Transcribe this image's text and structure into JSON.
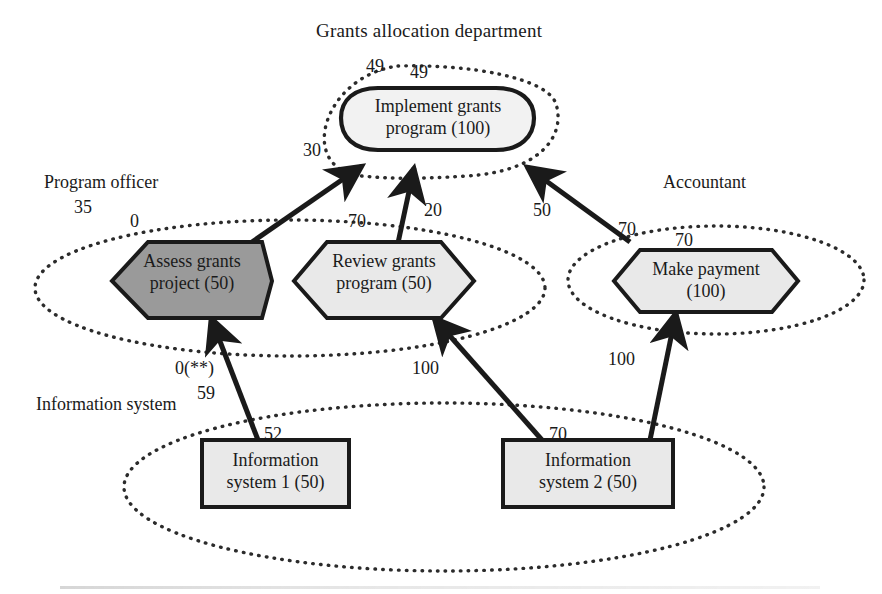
{
  "diagram": {
    "title": "Grants allocation department",
    "type": "actor-activity-flow-diagram",
    "colors": {
      "stroke": "#1a1a1a",
      "node_fill_light": "#e8e8e8",
      "node_fill_dark": "#9a9a9a",
      "boundary_dotted": "#2b2b2b",
      "background": "#ffffff"
    }
  },
  "swimlanes": [
    {
      "id": "grants-department",
      "label": "Grants allocation department",
      "boundary": "dotted-rounded"
    },
    {
      "id": "program-officer",
      "label": "Program officer",
      "boundary": "dotted-ellipse"
    },
    {
      "id": "accountant",
      "label": "Accountant",
      "boundary": "dotted-ellipse"
    },
    {
      "id": "information-system",
      "label": "Information system",
      "boundary": "dotted-ellipse"
    }
  ],
  "nodes": [
    {
      "id": "implement-grants-program",
      "line1": "Implement grants",
      "line2": "program (100)",
      "value": 100,
      "shape": "rounded-stadium",
      "fill": "light",
      "lane": "grants-department"
    },
    {
      "id": "assess-grants-project",
      "line1": "Assess grants",
      "line2": "project (50)",
      "value": 50,
      "shape": "hexagon",
      "fill": "dark",
      "lane": "program-officer"
    },
    {
      "id": "review-grants-program",
      "line1": "Review grants",
      "line2": "program (50)",
      "value": 50,
      "shape": "hexagon",
      "fill": "light",
      "lane": "program-officer"
    },
    {
      "id": "make-payment",
      "line1": "Make payment",
      "line2": "(100)",
      "value": 100,
      "shape": "hexagon",
      "fill": "light",
      "lane": "accountant"
    },
    {
      "id": "information-system-1",
      "line1": "Information",
      "line2": "system 1 (50)",
      "value": 50,
      "shape": "rectangle",
      "fill": "light",
      "lane": "information-system"
    },
    {
      "id": "information-system-2",
      "line1": "Information",
      "line2": "system 2 (50)",
      "value": 50,
      "shape": "rectangle",
      "fill": "light",
      "lane": "information-system"
    }
  ],
  "boundary_labels": [
    {
      "id": "dept-outer-49",
      "text": "49",
      "x": 366,
      "y": 56
    },
    {
      "id": "dept-inner-49",
      "text": "49",
      "x": 410,
      "y": 62
    },
    {
      "id": "dept-left-30",
      "text": "30",
      "x": 303,
      "y": 140
    },
    {
      "id": "officer-outer-35",
      "text": "35",
      "x": 74,
      "y": 197
    },
    {
      "id": "officer-inner-0",
      "text": "0",
      "x": 130,
      "y": 211
    },
    {
      "id": "officer-review-70",
      "text": "70",
      "x": 348,
      "y": 211
    },
    {
      "id": "accountant-outer-70",
      "text": "70",
      "x": 618,
      "y": 219
    },
    {
      "id": "accountant-inner-70",
      "text": "70",
      "x": 675,
      "y": 230
    },
    {
      "id": "infosys-outer-0",
      "text": "0(**)",
      "x": 175,
      "y": 358
    },
    {
      "id": "infosys-inner-59",
      "text": "59",
      "x": 197,
      "y": 383
    },
    {
      "id": "infosys1-52",
      "text": "52",
      "x": 264,
      "y": 424
    },
    {
      "id": "infosys2-70",
      "text": "70",
      "x": 549,
      "y": 424
    }
  ],
  "edges": [
    {
      "id": "assess-to-implement",
      "from": "assess-grants-project",
      "to": "implement-grants-program",
      "label": "30"
    },
    {
      "id": "review-to-implement",
      "from": "review-grants-program",
      "to": "implement-grants-program",
      "label": "20"
    },
    {
      "id": "payment-to-implement",
      "from": "make-payment",
      "to": "implement-grants-program",
      "label": "50"
    },
    {
      "id": "infosys1-to-assess",
      "from": "information-system-1",
      "to": "assess-grants-project",
      "label": "0(**)"
    },
    {
      "id": "infosys2-to-review",
      "from": "information-system-2",
      "to": "review-grants-program",
      "label": "100"
    },
    {
      "id": "infosys2-to-payment",
      "from": "information-system-2",
      "to": "make-payment",
      "label": "100"
    }
  ],
  "edge_labels": [
    {
      "id": "edge-label-20",
      "text": "20",
      "x": 424,
      "y": 200
    },
    {
      "id": "edge-label-50",
      "text": "50",
      "x": 533,
      "y": 200
    },
    {
      "id": "edge-label-100-left",
      "text": "100",
      "x": 412,
      "y": 358
    },
    {
      "id": "edge-label-100-right",
      "text": "100",
      "x": 608,
      "y": 349
    }
  ]
}
